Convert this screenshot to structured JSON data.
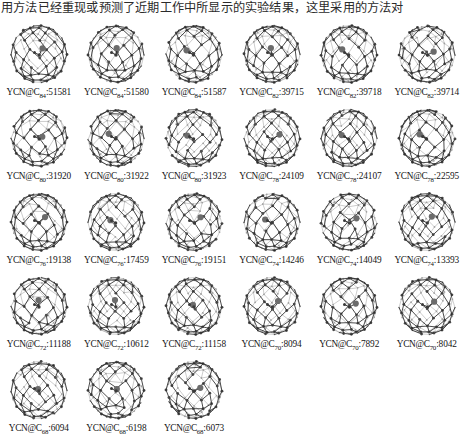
{
  "caption_top": "用方法已经重现或预测了近期工作中所显示的实验结果，这里采用的方法对",
  "figure": {
    "prefix": "YCN@C",
    "separator": ":",
    "colors": {
      "cage_bond": "#2b2b2b",
      "cage_atom": "#4d4d4d",
      "cluster_atom": "#6b6b6b",
      "background": "#ffffff"
    },
    "rows": [
      {
        "row_index": 1,
        "cells": [
          {
            "prefix": "YCN@C",
            "subscript": "84",
            "isomer": "51581",
            "label": "YCN@C84:51581"
          },
          {
            "prefix": "YCN@C",
            "subscript": "84",
            "isomer": "51580",
            "label": "YCN@C84:51580"
          },
          {
            "prefix": "YCN@C",
            "subscript": "84",
            "isomer": "51587",
            "label": "YCN@C84:51587"
          },
          {
            "prefix": "YCN@C",
            "subscript": "82",
            "isomer": "39715",
            "label": "YCN@C82:39715"
          },
          {
            "prefix": "YCN@C",
            "subscript": "82",
            "isomer": "39718",
            "label": "YCN@C82:39718"
          },
          {
            "prefix": "YCN@C",
            "subscript": "82",
            "isomer": "39714",
            "label": "YCN@C82:39714"
          }
        ]
      },
      {
        "row_index": 2,
        "cells": [
          {
            "prefix": "YCN@C",
            "subscript": "80",
            "isomer": "31920",
            "label": "YCN@C80:31920"
          },
          {
            "prefix": "YCN@C",
            "subscript": "80",
            "isomer": "31922",
            "label": "YCN@C80:31922"
          },
          {
            "prefix": "YCN@C",
            "subscript": "80",
            "isomer": "31923",
            "label": "YCN@C80:31923"
          },
          {
            "prefix": "YCN@C",
            "subscript": "78",
            "isomer": "24109",
            "label": "YCN@C78:24109"
          },
          {
            "prefix": "YCN@C",
            "subscript": "78",
            "isomer": "24107",
            "label": "YCN@C78:24107"
          },
          {
            "prefix": "YCN@C",
            "subscript": "78",
            "isomer": "22595",
            "label": "YCN@C78:22595"
          }
        ]
      },
      {
        "row_index": 3,
        "cells": [
          {
            "prefix": "YCN@C",
            "subscript": "76",
            "isomer": "19138",
            "label": "YCN@C76:19138"
          },
          {
            "prefix": "YCN@C",
            "subscript": "76",
            "isomer": "17459",
            "label": "YCN@C76:17459"
          },
          {
            "prefix": "YCN@C",
            "subscript": "76",
            "isomer": "19151",
            "label": "YCN@C76:19151"
          },
          {
            "prefix": "YCN@C",
            "subscript": "74",
            "isomer": "14246",
            "label": "YCN@C74:14246"
          },
          {
            "prefix": "YCN@C",
            "subscript": "74",
            "isomer": "14049",
            "label": "YCN@C74:14049"
          },
          {
            "prefix": "YCN@C",
            "subscript": "74",
            "isomer": "13393",
            "label": "YCN@C74:13393"
          }
        ]
      },
      {
        "row_index": 4,
        "cells": [
          {
            "prefix": "YCN@C",
            "subscript": "72",
            "isomer": "11188",
            "label": "YCN@C72:11188"
          },
          {
            "prefix": "YCN@C",
            "subscript": "72",
            "isomer": "10612",
            "label": "YCN@C72:10612"
          },
          {
            "prefix": "YCN@C",
            "subscript": "72",
            "isomer": "11158",
            "label": "YCN@C72:11158"
          },
          {
            "prefix": "YCN@C",
            "subscript": "70",
            "isomer": "8094",
            "label": "YCN@C70:8094"
          },
          {
            "prefix": "YCN@C",
            "subscript": "70",
            "isomer": "7892",
            "label": "YCN@C70:7892"
          },
          {
            "prefix": "YCN@C",
            "subscript": "70",
            "isomer": "8042",
            "label": "YCN@C70:8042"
          }
        ]
      },
      {
        "row_index": 5,
        "cells": [
          {
            "prefix": "YCN@C",
            "subscript": "68",
            "isomer": "6094",
            "label": "YCN@C68:6094"
          },
          {
            "prefix": "YCN@C",
            "subscript": "68",
            "isomer": "6198",
            "label": "YCN@C68:6198"
          },
          {
            "prefix": "YCN@C",
            "subscript": "68",
            "isomer": "6073",
            "label": "YCN@C68:6073"
          }
        ]
      }
    ]
  }
}
